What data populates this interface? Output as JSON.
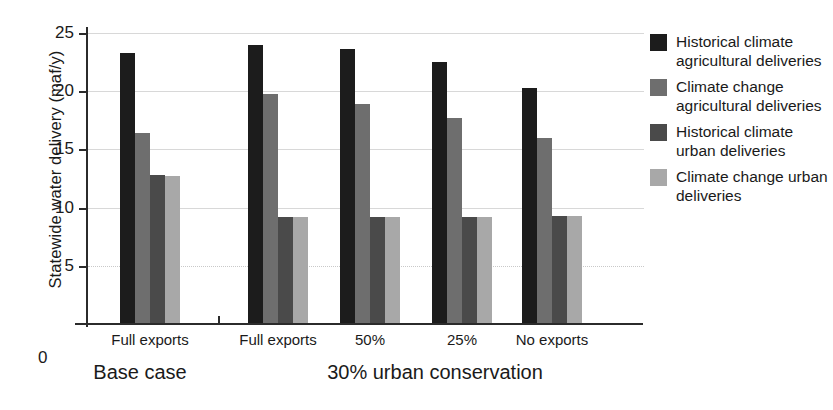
{
  "chart_data": {
    "type": "bar",
    "title": "",
    "xlabel": "",
    "ylabel": "Statewide water delivery (maf/y)",
    "ylim": [
      0,
      25
    ],
    "yticks": [
      0,
      5,
      10,
      15,
      20,
      25
    ],
    "grid": true,
    "legend_position": "right",
    "categories": [
      "Full exports",
      "Full exports",
      "50%",
      "25%",
      "No exports"
    ],
    "group_labels": [
      "Base case",
      "30% urban conservation"
    ],
    "group_spans": [
      1,
      4
    ],
    "series": [
      {
        "name": "Historical climate agricultural deliveries",
        "color": "#1c1c1c",
        "values": [
          23.3,
          24.0,
          23.6,
          22.5,
          20.3
        ]
      },
      {
        "name": "Climate change agricultural deliveries",
        "color": "#6e6e6e",
        "values": [
          16.4,
          19.8,
          18.9,
          17.7,
          16.0
        ]
      },
      {
        "name": "Historical climate urban deliveries",
        "color": "#4a4a4a",
        "values": [
          12.8,
          9.2,
          9.2,
          9.2,
          9.3
        ]
      },
      {
        "name": "Climate change urban deliveries",
        "color": "#a8a8a8",
        "values": [
          12.7,
          9.2,
          9.2,
          9.2,
          9.3
        ]
      }
    ]
  },
  "legend": {
    "items": [
      {
        "label": "Historical climate agricultural deliveries",
        "color": "#1c1c1c"
      },
      {
        "label": "Climate change agricultural deliveries",
        "color": "#6e6e6e"
      },
      {
        "label": "Historical climate urban deliveries",
        "color": "#4a4a4a"
      },
      {
        "label": "Climate change urban deliveries",
        "color": "#a8a8a8"
      }
    ]
  },
  "axis": {
    "y_title": "Statewide water delivery (maf/y)",
    "y_tick_labels": [
      "25",
      "20",
      "15",
      "10",
      "5"
    ],
    "zero_label": "0"
  }
}
